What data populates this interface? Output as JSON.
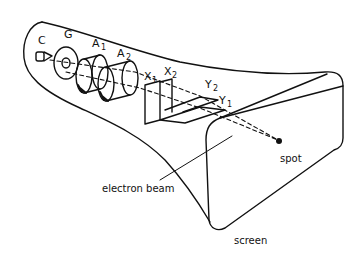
{
  "diagram": {
    "labels": {
      "cathode": "C",
      "grid": "G",
      "anode1": "A",
      "anode1_sub": "1",
      "anode2": "A",
      "anode2_sub": "2",
      "x1": "X",
      "x1_sub": "1",
      "x2": "X",
      "x2_sub": "2",
      "y1": "Y",
      "y1_sub": "1",
      "y2": "Y",
      "y2_sub": "2",
      "spot": "spot",
      "electron_beam": "electron beam",
      "screen": "screen"
    },
    "colors": {
      "ink": "#111111",
      "background": "#ffffff"
    }
  }
}
